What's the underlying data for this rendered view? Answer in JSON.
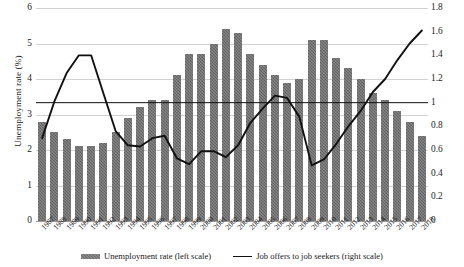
{
  "chart_data": {
    "type": "bar",
    "title": "",
    "xlabel": "",
    "ylabel": "Unemployment rate (%)",
    "ylabel_right": "Ratio of job opening to job applicants",
    "ylim": [
      0,
      6
    ],
    "ylim_right": [
      0,
      1.8
    ],
    "grid": true,
    "legend_position": "bottom",
    "categories": [
      "1987",
      "1988",
      "1989",
      "1990",
      "1991",
      "1992",
      "1993",
      "1994",
      "1995",
      "1996",
      "1997",
      "1998",
      "1999",
      "2000",
      "2001",
      "2002",
      "2003",
      "2004",
      "2005",
      "2006",
      "2007",
      "2008",
      "2009",
      "2010",
      "2011",
      "2012",
      "2013",
      "2014",
      "2015",
      "2016",
      "2017",
      "2018"
    ],
    "yticks_left": [
      "0",
      "1",
      "2",
      "3",
      "4",
      "5",
      "6"
    ],
    "yticks_right": [
      "0",
      "0.2",
      "0.4",
      "0.6",
      "0.8",
      "1",
      "1.2",
      "1.4",
      "1.6",
      "1.8"
    ],
    "reference_line": {
      "value": 1,
      "axis": "right",
      "label": "1"
    },
    "series": [
      {
        "name": "Unemployment rate (left scale)",
        "type": "bar",
        "axis": "left",
        "color": "#6d6d6d",
        "values": [
          2.8,
          2.5,
          2.3,
          2.1,
          2.1,
          2.2,
          2.5,
          2.9,
          3.2,
          3.4,
          3.4,
          4.1,
          4.7,
          4.7,
          5.0,
          5.4,
          5.3,
          4.7,
          4.4,
          4.1,
          3.9,
          4.0,
          5.1,
          5.1,
          4.6,
          4.3,
          4.0,
          3.6,
          3.4,
          3.1,
          2.8,
          2.4
        ]
      },
      {
        "name": "Job offers to job seekers (right scale)",
        "type": "line",
        "axis": "right",
        "color": "#111111",
        "values": [
          0.7,
          1.01,
          1.25,
          1.4,
          1.4,
          1.08,
          0.76,
          0.64,
          0.63,
          0.7,
          0.72,
          0.53,
          0.48,
          0.59,
          0.59,
          0.54,
          0.64,
          0.83,
          0.95,
          1.06,
          1.04,
          0.88,
          0.47,
          0.52,
          0.65,
          0.8,
          0.93,
          1.09,
          1.2,
          1.36,
          1.5,
          1.61
        ]
      }
    ]
  },
  "legend": {
    "items": [
      {
        "label": "Unemployment rate (left scale)",
        "marker": "bar-swatch"
      },
      {
        "label": "Job offers to job seekers (right scale)",
        "marker": "line-swatch"
      }
    ]
  }
}
